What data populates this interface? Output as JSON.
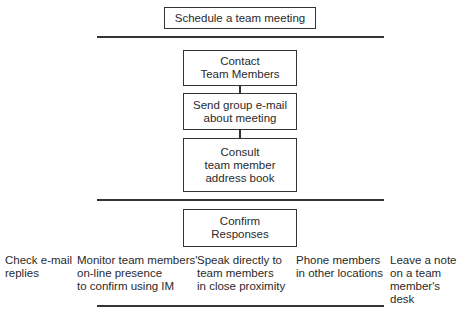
{
  "diagram": {
    "goal": "Schedule a team meeting",
    "steps": [
      "Contact\nTeam Members",
      "Send group e-mail\nabout meeting",
      "Consult\nteam member\naddress book"
    ],
    "confirm": "Confirm\nResponses",
    "confirm_options": [
      "Check e-mail\nreplies",
      "Monitor team members'\non-line presence\nto confirm using IM",
      "Speak directly to\nteam members\nin close proximity",
      "Phone members\nin other locations",
      "Leave a note\non a team\nmember's desk"
    ]
  }
}
